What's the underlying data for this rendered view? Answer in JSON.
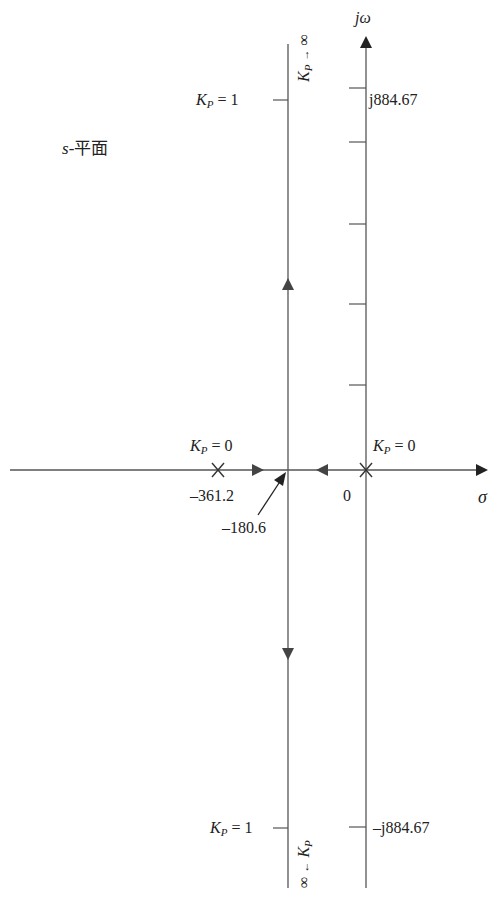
{
  "diagram": {
    "type": "root-locus",
    "plane_label": {
      "var": "s",
      "text": "-平面"
    },
    "axes": {
      "imag_label": "jω",
      "real_label": "σ",
      "origin_label": "0"
    },
    "poles": [
      {
        "value": "-361.2",
        "gain_label": {
          "k": "K",
          "sub": "P",
          "rest": " = 0"
        }
      },
      {
        "value": "0",
        "gain_label": {
          "k": "K",
          "sub": "P",
          "rest": " = 0"
        }
      }
    ],
    "breakaway": {
      "value": "–180.6"
    },
    "pole_left_value": "–361.2",
    "upper": {
      "gain_label": {
        "k": "K",
        "sub": "P",
        "rest": " = 1"
      },
      "imag_value": "j884.67",
      "infinity_label": {
        "k": "K",
        "sub": "P",
        "arrow": "→",
        "inf": "∞"
      }
    },
    "lower": {
      "gain_label": {
        "k": "K",
        "sub": "P",
        "rest": " = 1"
      },
      "imag_value": "–j884.67",
      "infinity_label": {
        "k": "K",
        "sub": "P",
        "arrow": "←",
        "inf": "∞"
      }
    },
    "colors": {
      "line": "#555555",
      "arrow": "#444444",
      "text": "#222222"
    }
  }
}
